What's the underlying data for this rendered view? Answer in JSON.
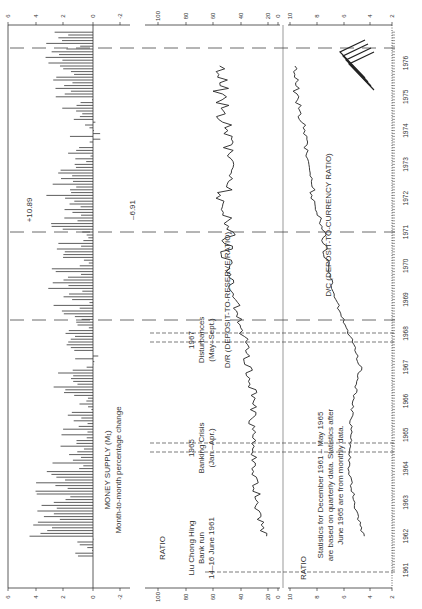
{
  "figure": {
    "orientation": "rotated-90-ccw",
    "panels": [
      {
        "id": "money-supply",
        "title": "MONEY SUPPLY (M₁)",
        "subtitle": "Month-to-month percentage change",
        "yticks": [
          "6",
          "4",
          "2",
          "0",
          "-2"
        ]
      },
      {
        "id": "dr-ratio",
        "axis_label": "RATIO",
        "yticks": [
          "100",
          "80",
          "60",
          "40",
          "20",
          "0"
        ],
        "series_label": "D/R (DEPOSIT-TO-RESERVE RATIO)"
      },
      {
        "id": "dc-ratio",
        "axis_label": "RATIO",
        "yticks": [
          "10",
          "8",
          "6",
          "4",
          "2"
        ],
        "series_label": "D/C (DEPOSIT-TO-CURRENCY RATIO)"
      }
    ],
    "x_years": [
      "1961",
      "1962",
      "1963",
      "1964",
      "1965",
      "1966",
      "1967",
      "1968",
      "1969",
      "1970",
      "1971",
      "1972",
      "1973",
      "1974",
      "1975",
      "1976"
    ],
    "annotations": {
      "liu": [
        "Liu Chong Hing",
        "Bank run",
        "14–16 June 1961"
      ],
      "crisis65": [
        "1965",
        "Banking Crisis",
        "(Jan.–Apr.)"
      ],
      "dist67": [
        "1967",
        "Disturbances",
        "(May–Sept.)"
      ],
      "peak": "+10.89",
      "trough": "–6.91",
      "note": [
        "Statistics for December 1961 – May 1965",
        "are based on quarterly data. Statistics after",
        "June 1965 are from monthly data."
      ]
    }
  },
  "chart_data": [
    {
      "type": "bar",
      "title": "MONEY SUPPLY (M₁)",
      "subtitle": "Month-to-month percentage change",
      "xlabel": "Year",
      "ylabel": "% change",
      "ylim": [
        -3,
        6
      ],
      "yticks": [
        6,
        4,
        2,
        0,
        -2
      ],
      "x_range": [
        "1961",
        "1976"
      ],
      "annotations": [
        "+10.89 (1972)",
        "-6.91 (1972)"
      ],
      "approx_values_by_year": {
        "1961": 1.0,
        "1962": 3.5,
        "1963": 2.8,
        "1964": 1.5,
        "1965": 1.0,
        "1966": 1.5,
        "1967": 0.5,
        "1968": 1.5,
        "1969": 1.8,
        "1970": 1.5,
        "1971": 2.0,
        "1972": 2.5,
        "1973": 0.5,
        "1974": 1.0,
        "1975": 1.5,
        "1976": 2.0
      }
    },
    {
      "type": "line",
      "series": [
        {
          "name": "D/R (DEPOSIT-TO-RESERVE RATIO)"
        }
      ],
      "ylabel": "RATIO",
      "ylim": [
        0,
        110
      ],
      "yticks": [
        100,
        80,
        60,
        40,
        20,
        0
      ],
      "x": [
        "1961",
        "1962",
        "1963",
        "1964",
        "1965",
        "1966",
        "1967",
        "1968",
        "1969",
        "1970",
        "1971",
        "1972",
        "1973",
        "1974",
        "1975",
        "1976"
      ],
      "values": [
        null,
        22,
        28,
        30,
        32,
        30,
        34,
        38,
        44,
        50,
        48,
        52,
        50,
        52,
        54,
        54
      ]
    },
    {
      "type": "line",
      "series": [
        {
          "name": "D/C (DEPOSIT-TO-CURRENCY RATIO)"
        }
      ],
      "ylabel": "RATIO",
      "ylim": [
        2,
        10
      ],
      "yticks": [
        10,
        8,
        6,
        4,
        2
      ],
      "x": [
        "1961",
        "1962",
        "1963",
        "1964",
        "1965",
        "1966",
        "1967",
        "1968",
        "1969",
        "1970",
        "1971",
        "1972",
        "1973",
        "1974",
        "1975",
        "1976"
      ],
      "values": [
        null,
        4.5,
        5.2,
        5.6,
        5.5,
        5.3,
        4.7,
        5.6,
        6.6,
        7.2,
        7.5,
        8.2,
        8.8,
        9.0,
        9.5,
        9.6
      ]
    }
  ]
}
